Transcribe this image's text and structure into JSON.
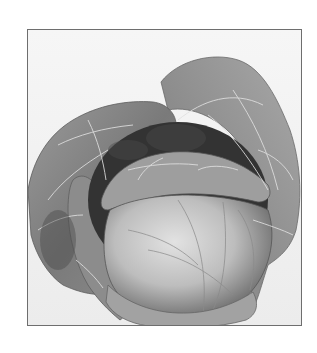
{
  "image": {
    "subject": "cabbage-head",
    "alt": "Black and white photograph of a cabbage head surrounded by large outer leaves",
    "style": "grayscale",
    "colors": {
      "background": "#ffffff",
      "frame_border": "#6e6e6e",
      "photo_background": "#f2f2f2",
      "outer_leaf": "#8a8a8a",
      "outer_leaf_dark": "#5a5a5a",
      "head": "#c4c4c4",
      "head_highlight": "#dedede",
      "veins": "#e8e8e8",
      "shadow": "#2e2e2e"
    }
  }
}
